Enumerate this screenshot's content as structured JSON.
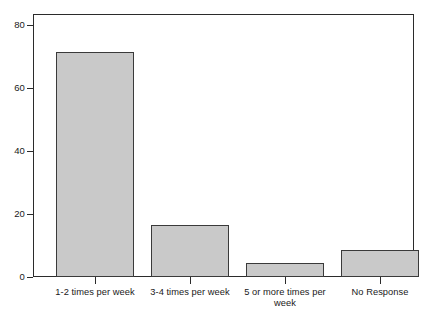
{
  "chart_data": {
    "type": "bar",
    "title": "",
    "subtitle": "",
    "xlabel": "",
    "ylabel": "",
    "categories": [
      "1-2 times per week",
      "3-4 times per week",
      "5 or more times per week",
      "No Response"
    ],
    "values": [
      72,
      16.5,
      4.5,
      8.7
    ],
    "ylim": [
      0,
      84
    ],
    "yticks": [
      0,
      20,
      40,
      60,
      80
    ],
    "ytick_labels": [
      "0",
      "20",
      "40",
      "60",
      "80"
    ],
    "grid": false,
    "legend": null,
    "bar_fill_color": "#c9c9c9",
    "bar_border_color": "#3a3a3a",
    "axis_color": "#2b2b2b",
    "background_color": "#ffffff"
  },
  "axes": {
    "y_tick_labels": [
      "0",
      "20",
      "40",
      "60",
      "80"
    ],
    "x_tick_labels": [
      "1-2 times per week",
      "3-4 times per week",
      "5 or more times per week",
      "No Response"
    ]
  }
}
